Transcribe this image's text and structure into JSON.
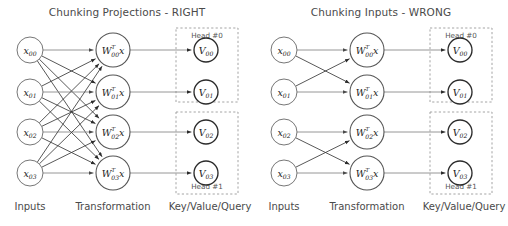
{
  "figure": {
    "width": 508,
    "height": 226,
    "background": "#ffffff"
  },
  "columns": {
    "inputs_label": "Inputs",
    "transformation_label": "Transformation",
    "keyvaluequery_label": "Key/Value/Query"
  },
  "panels": [
    {
      "id": "left",
      "title": "Chunking Projections - RIGHT",
      "origin_x": 0,
      "connection_pattern": "fully-connected",
      "inputs": [
        {
          "name": "x00",
          "base": "x",
          "sub": "00",
          "row": 0
        },
        {
          "name": "x01",
          "base": "x",
          "sub": "01",
          "row": 1
        },
        {
          "name": "x02",
          "base": "x",
          "sub": "02",
          "row": 2
        },
        {
          "name": "x03",
          "base": "x",
          "sub": "03",
          "row": 3
        }
      ],
      "transforms": [
        {
          "name": "W00",
          "base": "W",
          "sub": "00",
          "sup": "T",
          "suffix": "x",
          "row": 0
        },
        {
          "name": "W01",
          "base": "W",
          "sub": "01",
          "sup": "T",
          "suffix": "x",
          "row": 1
        },
        {
          "name": "W02",
          "base": "W",
          "sub": "02",
          "sup": "T",
          "suffix": "x",
          "row": 2
        },
        {
          "name": "W03",
          "base": "W",
          "sub": "03",
          "sup": "T",
          "suffix": "x",
          "row": 3
        }
      ],
      "outputs": [
        {
          "name": "V00",
          "base": "V",
          "sub": "00",
          "row": 0
        },
        {
          "name": "V01",
          "base": "V",
          "sub": "01",
          "row": 1
        },
        {
          "name": "V02",
          "base": "V",
          "sub": "02",
          "row": 2
        },
        {
          "name": "V03",
          "base": "V",
          "sub": "03",
          "row": 3
        }
      ],
      "heads": [
        {
          "label": "Head #0",
          "rows": [
            0,
            1
          ],
          "label_position": "top"
        },
        {
          "label": "Head #1",
          "rows": [
            2,
            3
          ],
          "label_position": "bottom"
        }
      ]
    },
    {
      "id": "right",
      "title": "Chunking Inputs - WRONG",
      "origin_x": 254,
      "connection_pattern": "block-connected",
      "inputs": [
        {
          "name": "x00",
          "base": "x",
          "sub": "00",
          "row": 0
        },
        {
          "name": "x01",
          "base": "x",
          "sub": "01",
          "row": 1
        },
        {
          "name": "x02",
          "base": "x",
          "sub": "02",
          "row": 2
        },
        {
          "name": "x03",
          "base": "x",
          "sub": "03",
          "row": 3
        }
      ],
      "transforms": [
        {
          "name": "W00",
          "base": "W",
          "sub": "00",
          "sup": "T",
          "suffix": "x",
          "row": 0
        },
        {
          "name": "W01",
          "base": "W",
          "sub": "01",
          "sup": "T",
          "suffix": "x",
          "row": 1
        },
        {
          "name": "W02",
          "base": "W",
          "sub": "02",
          "sup": "T",
          "suffix": "x",
          "row": 2
        },
        {
          "name": "W03",
          "base": "W",
          "sub": "03",
          "sup": "T",
          "suffix": "x",
          "row": 3
        }
      ],
      "outputs": [
        {
          "name": "V00",
          "base": "V",
          "sub": "00",
          "row": 0
        },
        {
          "name": "V01",
          "base": "V",
          "sub": "01",
          "row": 1
        },
        {
          "name": "V02",
          "base": "V",
          "sub": "02",
          "row": 2
        },
        {
          "name": "V03",
          "base": "V",
          "sub": "03",
          "row": 3
        }
      ],
      "heads": [
        {
          "label": "Head #0",
          "rows": [
            0,
            1
          ],
          "label_position": "top"
        },
        {
          "label": "Head #1",
          "rows": [
            2,
            3
          ],
          "label_position": "bottom"
        }
      ]
    }
  ],
  "geometry": {
    "row_y": [
      50,
      92,
      132,
      173
    ],
    "input_cx": 30,
    "transform_cx": 113,
    "output_cx": 206,
    "input_r": 13,
    "transform_r": 17,
    "output_r": 12,
    "title_y": 16,
    "column_label_y": 210,
    "input_label_x": 30,
    "transform_label_x": 113,
    "output_label_x": 210,
    "headbox": [
      {
        "x": 176,
        "y": 28,
        "w": 62,
        "h": 74
      },
      {
        "x": 176,
        "y": 112,
        "w": 62,
        "h": 82
      }
    ]
  },
  "colors": {
    "edge": "#3a3a3a",
    "edge_light": "#8a8a8a",
    "node_stroke_light": "#777777",
    "node_stroke_dark": "#2b2b2b",
    "headbox_stroke": "#9a9a9a",
    "text": "#4a4a4a",
    "background": "#ffffff"
  }
}
